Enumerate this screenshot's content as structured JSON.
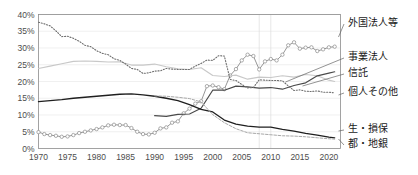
{
  "chart_data": {
    "type": "line",
    "title": "",
    "subtitle": "",
    "xlabel": "",
    "ylabel": "",
    "xlim": [
      1970,
      2022
    ],
    "ylim": [
      0,
      40
    ],
    "grid": true,
    "legend_position": "right-outside",
    "y_ticks": [
      "0%",
      "5%",
      "10%",
      "15%",
      "20%",
      "25%",
      "30%",
      "35%",
      "40%"
    ],
    "y_tick_values": [
      0,
      5,
      10,
      15,
      20,
      25,
      30,
      35,
      40
    ],
    "x_ticks": [
      "1970",
      "1975",
      "1980",
      "1985",
      "1990",
      "1995",
      "2000",
      "2005",
      "2010",
      "2015",
      "2020"
    ],
    "x_tick_values": [
      1970,
      1975,
      1980,
      1985,
      1990,
      1995,
      2000,
      2005,
      2010,
      2015,
      2020
    ],
    "series": [
      {
        "name": "外国法人等",
        "color": "#8a8a8a",
        "style": "solid-markers",
        "width": 0.9,
        "markers": true,
        "x": [
          1970,
          1971,
          1972,
          1973,
          1974,
          1975,
          1976,
          1977,
          1978,
          1979,
          1980,
          1981,
          1982,
          1983,
          1984,
          1985,
          1986,
          1987,
          1988,
          1989,
          1990,
          1991,
          1992,
          1993,
          1994,
          1995,
          1996,
          1997,
          1998,
          1999,
          2000,
          2001,
          2002,
          2003,
          2004,
          2005,
          2006,
          2007,
          2008,
          2009,
          2010,
          2011,
          2012,
          2013,
          2014,
          2015,
          2016,
          2017,
          2018,
          2019,
          2020,
          2021
        ],
        "values": [
          4.9,
          4.3,
          4.0,
          3.8,
          3.5,
          3.6,
          4.0,
          4.6,
          5.0,
          5.4,
          5.8,
          6.3,
          6.9,
          7.1,
          7.0,
          7.0,
          6.1,
          5.0,
          4.3,
          4.2,
          4.7,
          6.0,
          6.3,
          7.7,
          8.1,
          10.5,
          11.9,
          13.4,
          14.1,
          18.6,
          18.8,
          18.3,
          17.7,
          21.8,
          23.7,
          26.3,
          28.0,
          27.6,
          23.6,
          26.0,
          26.7,
          26.3,
          28.0,
          30.8,
          31.7,
          29.8,
          30.1,
          30.2,
          29.1,
          29.6,
          30.2,
          30.4
        ]
      },
      {
        "name": "事業法人",
        "color": "#c8c8c8",
        "style": "solid",
        "width": 1.1,
        "markers": false,
        "x": [
          1970,
          1972,
          1974,
          1976,
          1978,
          1980,
          1982,
          1984,
          1986,
          1988,
          1990,
          1992,
          1994,
          1996,
          1998,
          2000,
          2002,
          2004,
          2006,
          2008,
          2010,
          2012,
          2014,
          2016,
          2018,
          2020,
          2021
        ],
        "values": [
          23.9,
          24.6,
          25.3,
          26.0,
          26.1,
          26.0,
          25.8,
          25.9,
          24.9,
          24.9,
          25.2,
          24.4,
          23.8,
          23.6,
          24.1,
          21.8,
          21.5,
          21.9,
          20.7,
          21.3,
          21.2,
          21.7,
          21.3,
          22.1,
          21.7,
          20.4,
          20.0
        ]
      },
      {
        "name": "信託",
        "color": "#4a4a4a",
        "style": "solid",
        "width": 1.2,
        "markers": false,
        "x": [
          1990,
          1992,
          1994,
          1996,
          1998,
          2000,
          2002,
          2004,
          2006,
          2008,
          2010,
          2012,
          2014,
          2016,
          2018,
          2020,
          2021
        ],
        "values": [
          9.8,
          9.6,
          10.2,
          10.3,
          12.0,
          17.4,
          17.4,
          18.6,
          18.4,
          18.0,
          18.2,
          17.7,
          18.8,
          19.6,
          21.7,
          22.5,
          22.9
        ]
      },
      {
        "name": "個人その他",
        "color": "#6e6e6e",
        "style": "dotted",
        "width": 1.1,
        "markers": false,
        "x": [
          1970,
          1971,
          1972,
          1973,
          1974,
          1975,
          1976,
          1977,
          1978,
          1979,
          1980,
          1981,
          1982,
          1983,
          1984,
          1985,
          1986,
          1987,
          1988,
          1989,
          1990,
          1991,
          1992,
          1993,
          1994,
          1995,
          1996,
          1997,
          1998,
          1999,
          2000,
          2001,
          2002,
          2003,
          2004,
          2005,
          2006,
          2007,
          2008,
          2009,
          2010,
          2011,
          2012,
          2013,
          2014,
          2015,
          2016,
          2017,
          2018,
          2019,
          2020,
          2021
        ],
        "values": [
          37.7,
          37.2,
          36.6,
          35.1,
          33.4,
          33.5,
          32.9,
          32.0,
          30.8,
          30.4,
          29.2,
          28.4,
          28.0,
          26.8,
          26.3,
          25.2,
          23.9,
          23.6,
          22.4,
          22.6,
          23.1,
          23.2,
          23.9,
          23.7,
          23.6,
          23.6,
          23.6,
          24.6,
          25.4,
          26.4,
          26.3,
          27.7,
          27.6,
          20.6,
          20.3,
          19.1,
          18.1,
          18.2,
          20.5,
          20.4,
          20.3,
          20.3,
          20.2,
          18.7,
          17.3,
          17.5,
          17.1,
          17.0,
          17.2,
          16.8,
          16.8,
          16.6
        ]
      },
      {
        "name": "生・損保",
        "color": "#1f1f1f",
        "style": "solid",
        "width": 1.3,
        "markers": false,
        "x": [
          1970,
          1972,
          1974,
          1976,
          1978,
          1980,
          1982,
          1984,
          1986,
          1988,
          1990,
          1992,
          1994,
          1996,
          1998,
          2000,
          2002,
          2004,
          2006,
          2008,
          2010,
          2012,
          2014,
          2016,
          2018,
          2020,
          2021
        ],
        "values": [
          14.0,
          14.3,
          14.6,
          15.0,
          15.3,
          15.6,
          15.9,
          16.2,
          16.3,
          16.0,
          15.6,
          15.0,
          14.3,
          13.1,
          11.7,
          10.9,
          8.5,
          7.3,
          6.7,
          6.4,
          6.4,
          5.7,
          5.2,
          4.5,
          4.0,
          3.4,
          3.2
        ]
      },
      {
        "name": "都・地銀",
        "color": "#a8a8a8",
        "style": "dashed",
        "width": 1.0,
        "markers": false,
        "x": [
          1990,
          1992,
          1994,
          1996,
          1998,
          2000,
          2002,
          2004,
          2006,
          2008,
          2010,
          2012,
          2014,
          2016,
          2018,
          2020,
          2021
        ],
        "values": [
          15.7,
          15.6,
          15.3,
          14.9,
          13.9,
          10.1,
          7.7,
          5.9,
          4.7,
          4.4,
          4.1,
          3.8,
          3.7,
          3.5,
          3.2,
          2.9,
          2.8
        ]
      }
    ]
  },
  "legend": {
    "items": [
      {
        "label": "外国法人等"
      },
      {
        "label": "事業法人"
      },
      {
        "label": "信託"
      },
      {
        "label": "個人その他"
      },
      {
        "label": "生・損保"
      },
      {
        "label": "都・地銀"
      }
    ]
  }
}
